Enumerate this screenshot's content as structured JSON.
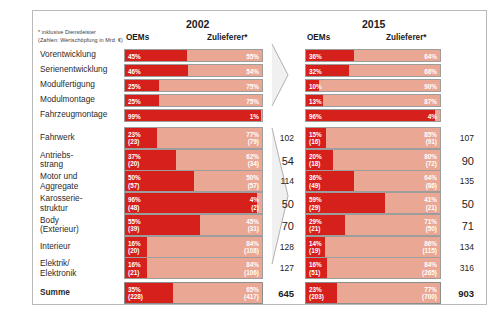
{
  "footnote": {
    "line1": "* inklusive Dienstleister",
    "line2": "(Zahlen: Wertschöpfung in Mrd. €)"
  },
  "headers": {
    "oem": "OEMs",
    "supplier": "Zulieferer*",
    "year_left": "2002",
    "year_right": "2015"
  },
  "icons": {
    "arrow_top": "arrow-right-icon",
    "arrow_bottom": "arrow-right-icon"
  },
  "colors": {
    "oem_red": "#d6201c",
    "supplier_salmon": "#e9a794",
    "border": "#9d9d9d",
    "text": "#1c1c1c"
  },
  "rows_top": [
    {
      "label": "Vorentwicklung",
      "y2002": {
        "oem_pct": "45%",
        "sup_pct": "55%"
      },
      "y2015": {
        "oem_pct": "36%",
        "sup_pct": "64%"
      }
    },
    {
      "label": "Serienentwicklung",
      "y2002": {
        "oem_pct": "46%",
        "sup_pct": "54%"
      },
      "y2015": {
        "oem_pct": "32%",
        "sup_pct": "68%"
      }
    },
    {
      "label": "Modulfertigung",
      "y2002": {
        "oem_pct": "25%",
        "sup_pct": "75%"
      },
      "y2015": {
        "oem_pct": "10%",
        "sup_pct": "90%"
      }
    },
    {
      "label": "Modulmontage",
      "y2002": {
        "oem_pct": "25%",
        "sup_pct": "75%"
      },
      "y2015": {
        "oem_pct": "13%",
        "sup_pct": "87%"
      }
    },
    {
      "label": "Fahrzeugmontage",
      "y2002": {
        "oem_pct": "99%",
        "sup_pct": "1%"
      },
      "y2015": {
        "oem_pct": "96%",
        "sup_pct": "4%"
      }
    }
  ],
  "rows_bottom": [
    {
      "label": "Fahrwerk",
      "y2002": {
        "oem_pct": "23%",
        "oem_val": "(23)",
        "sup_pct": "77%",
        "sup_val": "(79)",
        "total": "102"
      },
      "y2015": {
        "oem_pct": "15%",
        "oem_val": "(16)",
        "sup_pct": "85%",
        "sup_val": "(91)",
        "total": "107"
      }
    },
    {
      "label": "Antriebs-\nstrang",
      "y2002": {
        "oem_pct": "37%",
        "oem_val": "(20)",
        "sup_pct": "62%",
        "sup_val": "(34)",
        "total": "54"
      },
      "y2015": {
        "oem_pct": "20%",
        "oem_val": "(18)",
        "sup_pct": "80%",
        "sup_val": "(72)",
        "total": "90"
      }
    },
    {
      "label": "Motor und\nAggregate",
      "y2002": {
        "oem_pct": "50%",
        "oem_val": "(57)",
        "sup_pct": "50%",
        "sup_val": "(57)",
        "total": "114"
      },
      "y2015": {
        "oem_pct": "36%",
        "oem_val": "(49)",
        "sup_pct": "64%",
        "sup_val": "(86)",
        "total": "135"
      }
    },
    {
      "label": "Karosserie-\nstruktur",
      "y2002": {
        "oem_pct": "96%",
        "oem_val": "(48)",
        "sup_pct": "4%",
        "sup_val": "(2)",
        "total": "50"
      },
      "y2015": {
        "oem_pct": "59%",
        "oem_val": "(29)",
        "sup_pct": "41%",
        "sup_val": "(21)",
        "total": "50"
      }
    },
    {
      "label": "Body\n(Exterieur)",
      "y2002": {
        "oem_pct": "55%",
        "oem_val": "(39)",
        "sup_pct": "45%",
        "sup_val": "(31)",
        "total": "70"
      },
      "y2015": {
        "oem_pct": "29%",
        "oem_val": "(21)",
        "sup_pct": "71%",
        "sup_val": "(50)",
        "total": "71"
      }
    },
    {
      "label": "Interieur",
      "y2002": {
        "oem_pct": "16%",
        "oem_val": "(20)",
        "sup_pct": "84%",
        "sup_val": "(108)",
        "total": "128"
      },
      "y2015": {
        "oem_pct": "14%",
        "oem_val": "(19)",
        "sup_pct": "86%",
        "sup_val": "(115)",
        "total": "134"
      }
    },
    {
      "label": "Elektrik/\nElektronik",
      "y2002": {
        "oem_pct": "16%",
        "oem_val": "(21)",
        "sup_pct": "84%",
        "sup_val": "(106)",
        "total": "127"
      },
      "y2015": {
        "oem_pct": "16%",
        "oem_val": "(51)",
        "sup_pct": "84%",
        "sup_val": "(265)",
        "total": "316"
      }
    }
  ],
  "summe": {
    "label": "Summe",
    "y2002": {
      "oem_pct": "35%",
      "oem_val": "(228)",
      "sup_pct": "65%",
      "sup_val": "(417)",
      "total": "645"
    },
    "y2015": {
      "oem_pct": "23%",
      "oem_val": "(203)",
      "sup_pct": "77%",
      "sup_val": "(700)",
      "total": "903"
    }
  },
  "chart_data": {
    "type": "bar",
    "subtitle": "* inklusive Dienstleister (Zahlen: Wertschöpfung in Mrd. €)",
    "xlabel": "Anteil in Prozent",
    "ylabel": "",
    "xlim": [
      0,
      100
    ],
    "grid": false,
    "legend": [
      "OEMs",
      "Zulieferer*"
    ],
    "legend_position": "top",
    "stacked": true,
    "orientation": "horizontal",
    "categories": [
      "Vorentwicklung",
      "Serienentwicklung",
      "Modulfertigung",
      "Modulmontage",
      "Fahrzeugmontage",
      "Fahrwerk",
      "Antriebsstrang",
      "Motor und Aggregate",
      "Karosseriestruktur",
      "Body (Exterieur)",
      "Interieur",
      "Elektrik/Elektronik",
      "Summe"
    ],
    "panels": [
      {
        "year": "2002",
        "series": [
          {
            "name": "OEMs",
            "values": [
              45,
              46,
              25,
              25,
              99,
              23,
              37,
              50,
              96,
              55,
              16,
              16,
              35
            ]
          },
          {
            "name": "Zulieferer*",
            "values": [
              55,
              54,
              75,
              75,
              1,
              77,
              62,
              50,
              4,
              45,
              84,
              84,
              65
            ]
          }
        ],
        "value_labels_oem": [
          null,
          null,
          null,
          null,
          null,
          23,
          20,
          57,
          48,
          39,
          20,
          21,
          228
        ],
        "value_labels_supplier": [
          null,
          null,
          null,
          null,
          null,
          79,
          34,
          57,
          2,
          31,
          108,
          106,
          417
        ],
        "totals": [
          null,
          null,
          null,
          null,
          null,
          102,
          54,
          114,
          50,
          70,
          128,
          127,
          645
        ]
      },
      {
        "year": "2015",
        "series": [
          {
            "name": "OEMs",
            "values": [
              36,
              32,
              10,
              13,
              96,
              15,
              20,
              36,
              59,
              29,
              14,
              16,
              23
            ]
          },
          {
            "name": "Zulieferer*",
            "values": [
              64,
              68,
              90,
              87,
              4,
              85,
              80,
              64,
              41,
              71,
              86,
              84,
              77
            ]
          }
        ],
        "value_labels_oem": [
          null,
          null,
          null,
          null,
          null,
          16,
          18,
          49,
          29,
          21,
          19,
          51,
          203
        ],
        "value_labels_supplier": [
          null,
          null,
          null,
          null,
          null,
          91,
          72,
          86,
          21,
          50,
          115,
          265,
          700
        ],
        "totals": [
          null,
          null,
          null,
          null,
          null,
          107,
          90,
          135,
          50,
          71,
          134,
          316,
          903
        ]
      }
    ]
  }
}
